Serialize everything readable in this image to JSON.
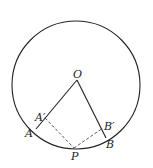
{
  "diagram": {
    "type": "geometry",
    "circle": {
      "cx": 76,
      "cy": 85,
      "r": 64
    },
    "points": {
      "O": {
        "label": "O",
        "x": 77,
        "y": 80
      },
      "A": {
        "label": "A",
        "x": 36,
        "y": 129
      },
      "A_prime": {
        "label": "A′",
        "x": 45,
        "y": 118
      },
      "B": {
        "label": "B",
        "x": 106,
        "y": 138
      },
      "B_prime": {
        "label": "B′",
        "x": 103,
        "y": 128
      },
      "P": {
        "label": "P",
        "x": 74,
        "y": 148
      }
    },
    "solid_segments": [
      "OA",
      "OB"
    ],
    "dashed_segments": [
      "A'P",
      "PB'"
    ],
    "colors": {
      "stroke": "#222222",
      "background": "#ffffff"
    }
  }
}
